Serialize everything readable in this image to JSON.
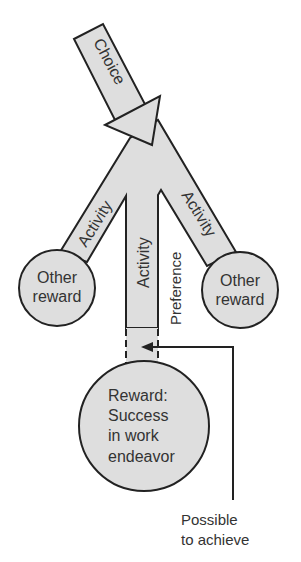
{
  "diagram": {
    "choice_label": "Choice",
    "branches": [
      {
        "label": "Activity",
        "position": "left"
      },
      {
        "label": "Activity",
        "position": "center"
      },
      {
        "label": "Activity",
        "position": "right"
      }
    ],
    "preference_label": "Preference",
    "other_rewards": [
      {
        "line1": "Other",
        "line2": "reward",
        "position": "left"
      },
      {
        "line1": "Other",
        "line2": "reward",
        "position": "right"
      }
    ],
    "main_reward": {
      "lines": [
        "Reward:",
        "Success",
        "in work",
        "endeavor"
      ]
    },
    "annotation": {
      "lines": [
        "Possible",
        "to achieve"
      ]
    },
    "colors": {
      "fill": "#dedede",
      "stroke": "#222222",
      "text": "#333333"
    }
  }
}
